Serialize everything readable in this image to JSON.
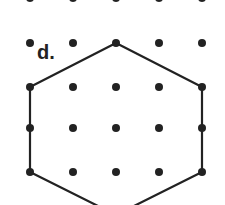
{
  "label": "d.",
  "colors": {
    "ink": "#222222",
    "background": "#ffffff"
  },
  "grid": {
    "columns_x": [
      30,
      73,
      116,
      159,
      202
    ],
    "rows_y": [
      -2,
      43,
      87,
      128,
      172
    ],
    "dot_radius": 4
  },
  "hexagon": {
    "vertices": [
      [
        116,
        43
      ],
      [
        202,
        87
      ],
      [
        202,
        172
      ],
      [
        116,
        215
      ],
      [
        30,
        172
      ],
      [
        30,
        87
      ]
    ],
    "stroke_width": 2.2
  }
}
